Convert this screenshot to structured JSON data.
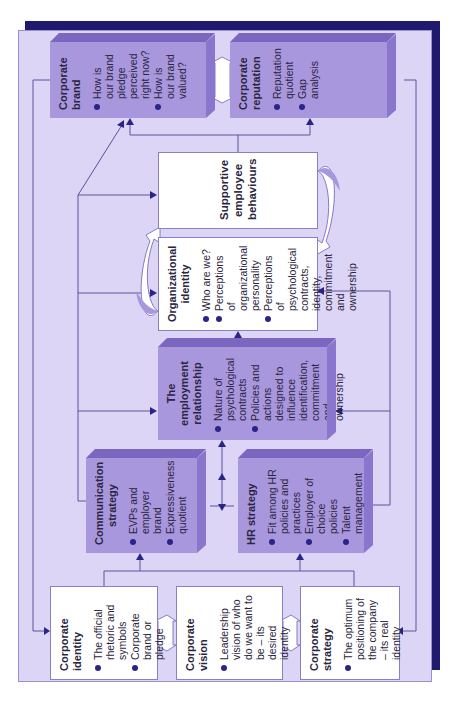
{
  "diagram": {
    "orientation": "rotated 90 degrees counterclockwise",
    "colors": {
      "frame_dark": "#1f1a6e",
      "panel": "#ddd5f5",
      "purple_box": "#a997de",
      "white_box": "#ffffff",
      "bullet": "#2a2488"
    },
    "boxes": {
      "corporate_identity": {
        "title": "Corporate identity",
        "bullets": [
          "The official rhetoric and symbols",
          "Corporate brand or pledge"
        ]
      },
      "corporate_vision": {
        "title": "Corporate vision",
        "bullets": [
          "Leadership vision of who do we want to be – its desired identity"
        ]
      },
      "corporate_strategy": {
        "title": "Corporate strategy",
        "bullets": [
          "The optimum positioning of the company – its real identity"
        ]
      },
      "communication_strategy": {
        "title": "Communication strategy",
        "bullets": [
          "EVPs and employer brand",
          "Expressiveness quotient"
        ]
      },
      "hr_strategy": {
        "title": "HR strategy",
        "bullets": [
          "Fit among HR policies and practices",
          "Employer of choice policies",
          "Talent management"
        ]
      },
      "employment_relationship": {
        "title": "The employment relationship",
        "bullets": [
          "Nature of psychological contracts",
          "Policies and actions designed to influence identification, commitment and ownership"
        ]
      },
      "organizational_identity": {
        "title": "Organizational identity",
        "bullets": [
          "Who are we?",
          "Perceptions of organizational personality",
          "Perceptions of psychological contracts, identity, commitment and ownership"
        ]
      },
      "supportive_behaviours": {
        "title": "Supportive employee behaviours"
      },
      "corporate_brand": {
        "title": "Corporate brand",
        "bullets": [
          "How is our brand pledge perceived right now?",
          "How is our brand valued?"
        ]
      },
      "corporate_reputation": {
        "title": "Corporate reputation",
        "bullets": [
          "Reputation quotient",
          "Gap analysis"
        ]
      }
    }
  }
}
